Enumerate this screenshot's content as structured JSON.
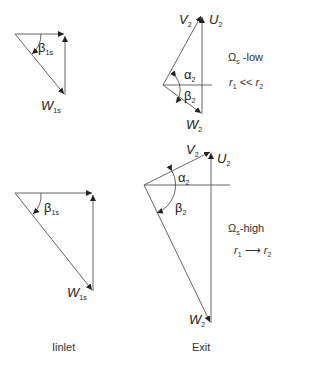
{
  "diagram": {
    "panels": {
      "inlet_low": {
        "angle": {
          "symbol": "β",
          "sub": "1s"
        },
        "vector": {
          "symbol": "W",
          "sub": "1s"
        }
      },
      "exit_low": {
        "abs_velocity": {
          "symbol": "V",
          "sub": "2"
        },
        "blade_velocity": {
          "symbol": "U",
          "sub": "2"
        },
        "rel_velocity": {
          "symbol": "W",
          "sub": "2"
        },
        "alpha": {
          "symbol": "α",
          "sub": "2"
        },
        "beta": {
          "symbol": "β",
          "sub": "2"
        },
        "speed_label": {
          "symbol": "Ω",
          "sub": "s",
          "text": " -low"
        },
        "radius_label": {
          "r1": "r",
          "r1_sub": "1",
          "rel": " << ",
          "r2": "r",
          "r2_sub": "2"
        }
      },
      "inlet_high": {
        "angle": {
          "symbol": "β",
          "sub": "1s"
        },
        "vector": {
          "symbol": "W",
          "sub": "1s"
        }
      },
      "exit_high": {
        "abs_velocity": {
          "symbol": "V",
          "sub": "2"
        },
        "blade_velocity": {
          "symbol": "U",
          "sub": "2"
        },
        "rel_velocity": {
          "symbol": "W",
          "sub": "2"
        },
        "alpha": {
          "symbol": "α",
          "sub": "2"
        },
        "beta": {
          "symbol": "β",
          "sub": "2"
        },
        "speed_label": {
          "symbol": "Ω",
          "sub": "s",
          "text": "-high"
        },
        "radius_label": {
          "r1": "r",
          "r1_sub": "1",
          "rel": " ⟶ ",
          "r2": "r",
          "r2_sub": "2"
        }
      }
    },
    "captions": {
      "inlet": "Iinlet",
      "exit": "Exit"
    },
    "colors": {
      "line": "#555555",
      "text": "#222222"
    }
  }
}
